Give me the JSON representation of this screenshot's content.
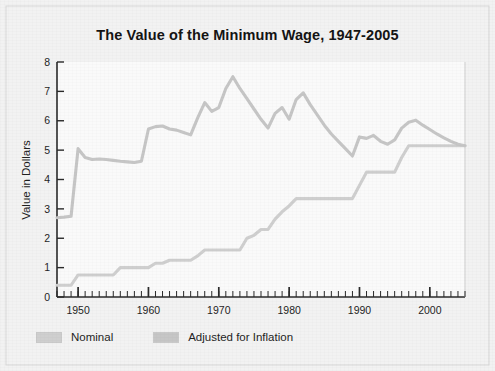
{
  "figure": {
    "title": "The Value of the Minimum Wage, 1947-2005",
    "background_color": "#f2f2f2",
    "plot_background_color": "#fafafa",
    "border_color": "#d6d6d6"
  },
  "legend": {
    "position": "below-plot-left",
    "entries": [
      {
        "label": "Nominal",
        "color": "#cfcfcf",
        "swatch_name": "legend-swatch-nominal"
      },
      {
        "label": "Adjusted for Inflation",
        "color": "#c6c6c6",
        "swatch_name": "legend-swatch-adjusted"
      }
    ]
  },
  "chart_data": {
    "type": "line",
    "title": "The Value of the Minimum Wage, 1947-2005",
    "xlabel": "",
    "ylabel": "Value in Dollars",
    "xlim": [
      1947,
      2005
    ],
    "ylim": [
      0,
      8
    ],
    "grid": false,
    "x_major_ticks": [
      1950,
      1960,
      1970,
      1980,
      1990,
      2000
    ],
    "x_major_tick_labels": [
      "1950",
      "1960",
      "1970",
      "1980",
      "1990",
      "2000"
    ],
    "x_minor_tick_interval": 1,
    "y_ticks": [
      0,
      1,
      2,
      3,
      4,
      5,
      6,
      7,
      8
    ],
    "y_tick_labels": [
      "0",
      "1",
      "2",
      "3",
      "4",
      "5",
      "6",
      "7",
      "8"
    ],
    "x": [
      1947,
      1948,
      1949,
      1950,
      1951,
      1952,
      1953,
      1954,
      1955,
      1956,
      1957,
      1958,
      1959,
      1960,
      1961,
      1962,
      1963,
      1964,
      1965,
      1966,
      1967,
      1968,
      1969,
      1970,
      1971,
      1972,
      1973,
      1974,
      1975,
      1976,
      1977,
      1978,
      1979,
      1980,
      1981,
      1982,
      1983,
      1984,
      1985,
      1986,
      1987,
      1988,
      1989,
      1990,
      1991,
      1992,
      1993,
      1994,
      1995,
      1996,
      1997,
      1998,
      1999,
      2000,
      2001,
      2002,
      2003,
      2004,
      2005
    ],
    "series": [
      {
        "name": "Nominal",
        "color": "#cfcfcf",
        "values": [
          0.4,
          0.4,
          0.4,
          0.75,
          0.75,
          0.75,
          0.75,
          0.75,
          0.75,
          1.0,
          1.0,
          1.0,
          1.0,
          1.0,
          1.15,
          1.15,
          1.25,
          1.25,
          1.25,
          1.25,
          1.4,
          1.6,
          1.6,
          1.6,
          1.6,
          1.6,
          1.6,
          2.0,
          2.1,
          2.3,
          2.3,
          2.65,
          2.9,
          3.1,
          3.35,
          3.35,
          3.35,
          3.35,
          3.35,
          3.35,
          3.35,
          3.35,
          3.35,
          3.8,
          4.25,
          4.25,
          4.25,
          4.25,
          4.25,
          4.75,
          5.15,
          5.15,
          5.15,
          5.15,
          5.15,
          5.15,
          5.15,
          5.15,
          5.15
        ]
      },
      {
        "name": "Adjusted for Inflation",
        "color": "#c6c6c6",
        "values": [
          2.7,
          2.72,
          2.75,
          5.05,
          4.75,
          4.68,
          4.7,
          4.68,
          4.65,
          4.62,
          4.6,
          4.58,
          4.62,
          5.72,
          5.8,
          5.82,
          5.72,
          5.68,
          5.6,
          5.52,
          6.1,
          6.62,
          6.32,
          6.45,
          7.1,
          7.5,
          7.1,
          6.75,
          6.4,
          6.05,
          5.75,
          6.25,
          6.45,
          6.05,
          6.72,
          6.95,
          6.55,
          6.2,
          5.85,
          5.55,
          5.3,
          5.05,
          4.8,
          5.45,
          5.4,
          5.5,
          5.3,
          5.2,
          5.35,
          5.75,
          5.95,
          6.02,
          5.85,
          5.7,
          5.55,
          5.42,
          5.3,
          5.2,
          5.15
        ]
      }
    ]
  }
}
